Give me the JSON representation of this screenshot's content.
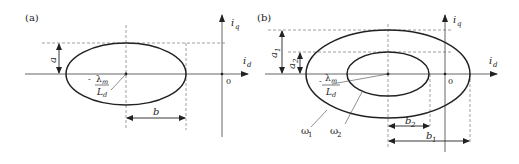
{
  "figure": {
    "panels": [
      {
        "id": "a",
        "label": "(a)",
        "axes": {
          "x_label": "i",
          "x_sub": "d",
          "y_label": "i",
          "y_sub": "q",
          "origin": "0"
        },
        "center_label": {
          "num": "λ",
          "num_sub": "m",
          "prefix": "-",
          "den": "L",
          "den_sub": "d"
        },
        "ellipses": [
          {
            "name": "ellipse"
          }
        ],
        "dimensions": {
          "semi_minor": "a",
          "semi_major": "b"
        }
      },
      {
        "id": "b",
        "label": "(b)",
        "axes": {
          "x_label": "i",
          "x_sub": "d",
          "y_label": "i",
          "y_sub": "q",
          "origin": "0"
        },
        "center_label": {
          "num": "λ",
          "num_sub": "m",
          "prefix": "-",
          "den": "L",
          "den_sub": "d"
        },
        "ellipses": [
          {
            "name": "outer",
            "speed": "ω",
            "speed_sub": "1"
          },
          {
            "name": "inner",
            "speed": "ω",
            "speed_sub": "2"
          }
        ],
        "dimensions": {
          "a1": "a",
          "a1_sub": "1",
          "a2": "a",
          "a2_sub": "2",
          "b1": "b",
          "b1_sub": "1",
          "b2": "b",
          "b2_sub": "2"
        }
      }
    ]
  },
  "colors": {
    "stroke": "#222222",
    "axis": "#555555",
    "dash": "#777777"
  }
}
